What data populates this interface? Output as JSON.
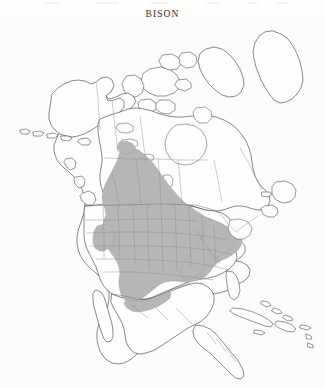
{
  "page": {
    "title": "BISON",
    "background_color": "#ffffff",
    "width": 325,
    "height": 388
  },
  "map": {
    "name": "north-america-range-map",
    "subject": "Bison",
    "projection_note": "North America, polar-style conic",
    "colors": {
      "range_fill": "#b6b6b6",
      "range_outline": "#9a9a9a",
      "coastline": "#3d3d3d",
      "internal_boundary": "#8e8e8e",
      "land_fill": "#ffffff",
      "water_fill": "#ffffff"
    },
    "legend_present": false,
    "labels_present": false,
    "regions_shown": [
      "Alaska",
      "Canada",
      "Greenland (west coast)",
      "Canadian Arctic Archipelago",
      "Contiguous United States",
      "Mexico",
      "Central America",
      "Caribbean islands"
    ],
    "range_description": "Historic bison range: wedge from Great Slave Lake in Northwest Territories south through the Great Plains to northern Mexico, and east across the Midwest and Appalachians to the Atlantic seaboard; excludes Florida, New England, the Pacific coast and the desert Southwest; isolated patch in the Great Basin / eastern Oregon.",
    "range_extent": {
      "north": "Great Slave Lake, Northwest Territories",
      "south": "Northern Mexico / Gulf coast of Texas",
      "east": "Atlantic seaboard (Virginia / Carolinas)",
      "west": "Eastern Rocky Mountain front, with disjunct Great Basin patch"
    }
  }
}
